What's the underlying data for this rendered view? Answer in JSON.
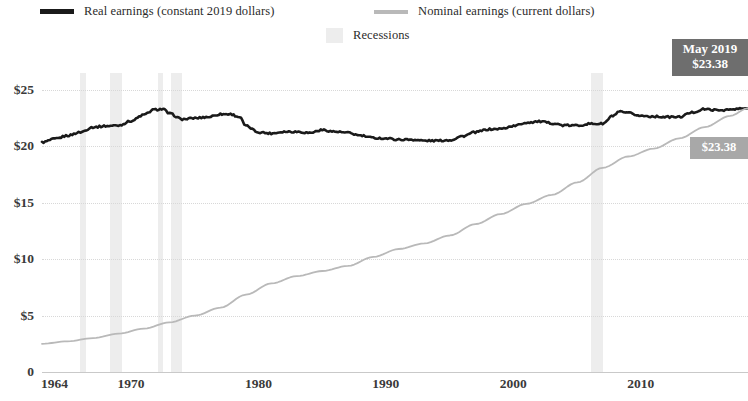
{
  "legend": {
    "items": [
      {
        "label": "Real earnings (constant 2019 dollars)",
        "swatch": "line-dark",
        "color": "#1a1a1a"
      },
      {
        "label": "Nominal earnings (current dollars)",
        "swatch": "line-light",
        "color": "#b9b9b9"
      },
      {
        "label": "Recessions",
        "swatch": "shaded-box",
        "color": "#ededed"
      }
    ]
  },
  "callouts": {
    "primary": {
      "line1": "May 2019",
      "line2": "$23.38",
      "background": "#6e6e6e"
    },
    "secondary": {
      "line1": "$23.38",
      "background": "#a8a8a8"
    }
  },
  "axis": {
    "y_ticks": [
      "$25",
      "$20",
      "$15",
      "$10",
      "$5",
      "0"
    ],
    "x_ticks": [
      "1964",
      "1970",
      "1980",
      "1990",
      "2000",
      "2010"
    ]
  },
  "chart_data": {
    "type": "line",
    "title": "",
    "subtitle": "",
    "xlabel": "",
    "ylabel": "",
    "xlim": [
      1964,
      2019.4
    ],
    "ylim": [
      0,
      26.5
    ],
    "y_ticks": [
      0,
      5,
      10,
      15,
      20,
      25
    ],
    "y_tick_labels": [
      "0",
      "$5",
      "$10",
      "$15",
      "$20",
      "$25"
    ],
    "x_ticks": [
      1964,
      1970,
      1980,
      1990,
      2000,
      2010
    ],
    "x_tick_labels": [
      "1964",
      "1970",
      "1980",
      "1990",
      "2000",
      "2010"
    ],
    "grid": "horizontal-dotted",
    "legend_position": "top",
    "series": [
      {
        "name": "Real earnings (constant 2019 dollars)",
        "color": "#1a1a1a",
        "x": [
          1964.0,
          1965.0,
          1966.0,
          1967.0,
          1968.0,
          1969.0,
          1970.0,
          1971.0,
          1972.0,
          1972.8,
          1973.5,
          1974.0,
          1975.0,
          1976.0,
          1977.0,
          1978.0,
          1978.8,
          1979.5,
          1980.0,
          1981.0,
          1982.0,
          1983.0,
          1984.0,
          1985.0,
          1986.0,
          1987.0,
          1988.0,
          1989.0,
          1990.0,
          1991.0,
          1992.0,
          1993.0,
          1994.0,
          1995.0,
          1996.0,
          1997.0,
          1998.0,
          1999.0,
          2000.0,
          2001.0,
          2002.0,
          2003.0,
          2004.0,
          2005.0,
          2006.0,
          2007.0,
          2008.0,
          2008.8,
          2009.3,
          2010.0,
          2011.0,
          2012.0,
          2013.0,
          2014.0,
          2015.0,
          2016.0,
          2017.0,
          2018.0,
          2019.0,
          2019.4
        ],
        "y": [
          20.35,
          20.65,
          20.95,
          21.25,
          21.7,
          21.8,
          21.85,
          22.25,
          22.8,
          23.25,
          23.3,
          22.9,
          22.4,
          22.5,
          22.6,
          22.85,
          22.85,
          22.6,
          21.8,
          21.25,
          21.15,
          21.3,
          21.3,
          21.2,
          21.45,
          21.3,
          21.2,
          20.95,
          20.75,
          20.7,
          20.6,
          20.6,
          20.5,
          20.5,
          20.55,
          20.9,
          21.25,
          21.5,
          21.55,
          21.8,
          22.1,
          22.2,
          22.05,
          21.85,
          21.85,
          22.0,
          22.0,
          22.7,
          23.05,
          22.95,
          22.7,
          22.65,
          22.6,
          22.6,
          23.0,
          23.3,
          23.2,
          23.25,
          23.35,
          23.38
        ]
      },
      {
        "name": "Nominal earnings (current dollars)",
        "color": "#b9b9b9",
        "x": [
          1964.0,
          1966.0,
          1968.0,
          1970.0,
          1972.0,
          1974.0,
          1976.0,
          1978.0,
          1980.0,
          1982.0,
          1984.0,
          1986.0,
          1988.0,
          1990.0,
          1992.0,
          1994.0,
          1996.0,
          1998.0,
          2000.0,
          2002.0,
          2004.0,
          2006.0,
          2008.0,
          2010.0,
          2012.0,
          2014.0,
          2016.0,
          2018.0,
          2019.4
        ],
        "y": [
          2.5,
          2.72,
          3.0,
          3.4,
          3.85,
          4.4,
          5.0,
          5.7,
          6.85,
          7.85,
          8.5,
          8.95,
          9.4,
          10.2,
          10.9,
          11.4,
          12.1,
          13.1,
          14.0,
          14.9,
          15.7,
          16.8,
          18.1,
          19.1,
          19.8,
          20.7,
          21.7,
          22.7,
          23.38
        ]
      }
    ],
    "recessions": [
      {
        "start": 1966.95,
        "end": 1967.45
      },
      {
        "start": 1969.35,
        "end": 1970.25
      },
      {
        "start": 1973.1,
        "end": 1973.5
      },
      {
        "start": 1974.15,
        "end": 1975.0
      },
      {
        "start": 2007.1,
        "end": 2008.0
      }
    ]
  }
}
